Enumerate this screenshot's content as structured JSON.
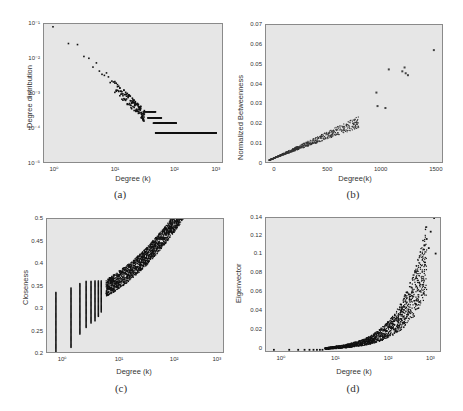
{
  "panels": {
    "a": {
      "caption": "(a)",
      "xlabel": "Degree (k)",
      "ylabel": "Degree distribution",
      "xticks": [
        "10⁰",
        "10¹",
        "10²",
        "10³"
      ],
      "yticks": [
        "10⁻¹",
        "10⁻²",
        "10⁻³",
        "10⁻⁴",
        "10⁻⁵"
      ]
    },
    "b": {
      "caption": "(b)",
      "xlabel": "Degree(k)",
      "ylabel": "Normalized Betweenness",
      "xticks": [
        "0",
        "500",
        "1000",
        "1500"
      ],
      "yticks": [
        "0.07",
        "0.06",
        "0.05",
        "0.04",
        "0.03",
        "0.02",
        "0.01",
        "0"
      ]
    },
    "c": {
      "caption": "(c)",
      "xlabel": "Degree (k)",
      "ylabel": "Closeness",
      "xticks": [
        "10⁰",
        "10¹",
        "10²",
        "10³"
      ],
      "yticks": [
        "0.5",
        "0.45",
        "0.4",
        "0.35",
        "0.3",
        "0.25",
        "0.2"
      ]
    },
    "d": {
      "caption": "(d)",
      "xlabel": "Degree (k)",
      "ylabel": "Eigenvector",
      "xticks": [
        "10⁰",
        "10¹",
        "10²",
        "10³"
      ],
      "yticks": [
        "0.14",
        "0.12",
        "0.1",
        "0.08",
        "0.06",
        "0.04",
        "0.02",
        "0"
      ]
    }
  },
  "chart_data": [
    {
      "id": "a",
      "type": "scatter",
      "title": "",
      "xlabel": "Degree (k)",
      "ylabel": "Degree distribution",
      "xscale": "log",
      "yscale": "log",
      "xlim": [
        0.8,
        2000
      ],
      "ylim": [
        1e-05,
        0.2
      ],
      "x": [
        1,
        2,
        3,
        4,
        5,
        6,
        7,
        8,
        10,
        12,
        14,
        16,
        20,
        25,
        30,
        40,
        50,
        60,
        70,
        80,
        100,
        120,
        150,
        200,
        300,
        500,
        800,
        1500
      ],
      "y": [
        0.19,
        0.13,
        0.095,
        0.07,
        0.05,
        0.04,
        0.032,
        0.025,
        0.016,
        0.012,
        0.0095,
        0.008,
        0.005,
        0.0035,
        0.0028,
        0.0018,
        0.0013,
        0.001,
        0.0008,
        0.0006,
        0.0004,
        0.00035,
        0.00025,
        0.00018,
        0.00018,
        9e-05,
        9e-05,
        9e-05
      ],
      "notes": "power-law decay; tail flattens into horizontal bands at ~1e-4 and ~2e-4 for k>100"
    },
    {
      "id": "b",
      "type": "scatter",
      "title": "",
      "xlabel": "Degree(k)",
      "ylabel": "Normalized Betweenness",
      "xlim": [
        -30,
        1550
      ],
      "ylim": [
        -0.002,
        0.07
      ],
      "x": [
        10,
        50,
        100,
        150,
        200,
        250,
        300,
        350,
        400,
        450,
        500,
        550,
        600,
        650,
        700,
        750,
        800,
        950,
        960,
        1030,
        1060,
        1180,
        1200,
        1230,
        1460
      ],
      "y": [
        0.0005,
        0.001,
        0.002,
        0.003,
        0.004,
        0.005,
        0.006,
        0.008,
        0.009,
        0.01,
        0.012,
        0.015,
        0.018,
        0.02,
        0.024,
        0.022,
        0.021,
        0.035,
        0.028,
        0.027,
        0.047,
        0.046,
        0.047,
        0.045,
        0.057
      ]
    },
    {
      "id": "c",
      "type": "scatter",
      "title": "",
      "xlabel": "Degree (k)",
      "ylabel": "Closeness",
      "xscale": "log",
      "xlim": [
        0.8,
        2000
      ],
      "ylim": [
        0.195,
        0.5
      ],
      "x": [
        1,
        1,
        2,
        2,
        3,
        3,
        4,
        5,
        7,
        10,
        20,
        50,
        100,
        200,
        500,
        1000,
        1500
      ],
      "y": [
        0.2,
        0.335,
        0.21,
        0.345,
        0.24,
        0.355,
        0.36,
        0.36,
        0.36,
        0.36,
        0.37,
        0.38,
        0.4,
        0.42,
        0.45,
        0.48,
        0.5
      ],
      "notes": "vertical bands at low integer degrees spanning ~0.25–0.35; upward trend above k≈10"
    },
    {
      "id": "d",
      "type": "scatter",
      "title": "",
      "xlabel": "Degree (k)",
      "ylabel": "Eigenvector",
      "xscale": "log",
      "xlim": [
        0.7,
        2000
      ],
      "ylim": [
        -0.003,
        0.145
      ],
      "x": [
        1,
        2,
        3,
        5,
        10,
        20,
        50,
        100,
        150,
        200,
        300,
        500,
        700,
        900,
        1000,
        1200,
        1500
      ],
      "y": [
        0,
        0,
        0,
        0.001,
        0.002,
        0.004,
        0.008,
        0.015,
        0.025,
        0.035,
        0.05,
        0.07,
        0.09,
        0.1,
        0.12,
        0.13,
        0.145
      ]
    }
  ]
}
